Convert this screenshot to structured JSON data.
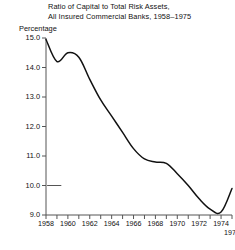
{
  "chart_data": {
    "type": "line",
    "title": "Ratio of Capital to Total Risk Assets,",
    "subtitle": "All Insured Commercial Banks, 1958–1975",
    "ylabel": "Percentage",
    "xlabel": "",
    "ylim": [
      9.0,
      15.0
    ],
    "xlim": [
      1958,
      1975
    ],
    "grid": false,
    "legend": false,
    "line_color": "#111111",
    "y_ticks": [
      "15.0",
      "14.0",
      "13.0",
      "12.0",
      "11.0",
      "10.0",
      "9.0"
    ],
    "y_tick_values": [
      15.0,
      14.0,
      13.0,
      12.0,
      11.0,
      10.0,
      9.0
    ],
    "x_ticks_all": [
      1958,
      1959,
      1960,
      1961,
      1962,
      1963,
      1964,
      1965,
      1966,
      1967,
      1968,
      1969,
      1970,
      1971,
      1972,
      1973,
      1974,
      1975
    ],
    "x_tick_labels": [
      "1958",
      "1960",
      "1962",
      "1964",
      "1966",
      "1968",
      "1970",
      "1972",
      "1974"
    ],
    "x_tick_label_values": [
      1958,
      1960,
      1962,
      1964,
      1966,
      1968,
      1970,
      1972,
      1974
    ],
    "x_end_label": "1975",
    "x": [
      1958,
      1959,
      1960,
      1961,
      1962,
      1963,
      1964,
      1965,
      1966,
      1967,
      1968,
      1969,
      1970,
      1971,
      1972,
      1973,
      1974,
      1975
    ],
    "values": [
      14.95,
      14.2,
      14.5,
      14.35,
      13.6,
      12.9,
      12.35,
      11.8,
      11.25,
      10.9,
      10.8,
      10.75,
      10.4,
      10.0,
      9.55,
      9.2,
      9.1,
      9.9
    ],
    "series": [
      {
        "name": "Ratio of Capital to Total Risk Assets",
        "values": [
          14.95,
          14.2,
          14.5,
          14.35,
          13.6,
          12.9,
          12.35,
          11.8,
          11.25,
          10.9,
          10.8,
          10.75,
          10.4,
          10.0,
          9.55,
          9.2,
          9.1,
          9.9
        ]
      }
    ],
    "annotations": [
      {
        "name": "tick-dash-10",
        "y": 10.0,
        "x_start": 1958.1,
        "x_end": 1959.4
      }
    ]
  }
}
